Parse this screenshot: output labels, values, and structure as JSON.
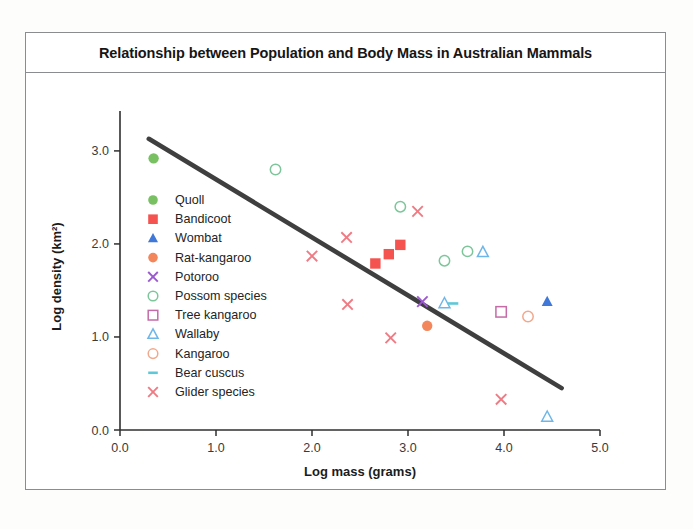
{
  "chart_data": {
    "type": "scatter",
    "title": "Relationship between Population and Body Mass in Australian Mammals",
    "xlabel": "Log mass (grams)",
    "ylabel": "Log density (km²)",
    "xlim": [
      0.0,
      5.0
    ],
    "ylim": [
      0.0,
      3.3
    ],
    "xticks": [
      "0.0",
      "1.0",
      "2.0",
      "3.0",
      "4.0",
      "5.0"
    ],
    "yticks": [
      "0.0",
      "1.0",
      "2.0",
      "3.0"
    ],
    "grid": false,
    "legend_position": "inside-left",
    "trendline": {
      "name": "regression-line",
      "color": "#3f3f3f",
      "x0": 0.3,
      "y0": 3.13,
      "x1": 4.6,
      "y1": 0.45
    },
    "series": [
      {
        "name": "Quoll",
        "marker": "circle-filled",
        "color": "#79c063",
        "points": [
          [
            0.35,
            2.92
          ]
        ]
      },
      {
        "name": "Bandicoot",
        "marker": "square-filled",
        "color": "#f4534f",
        "points": [
          [
            2.66,
            1.79
          ],
          [
            2.8,
            1.89
          ],
          [
            2.92,
            1.99
          ]
        ]
      },
      {
        "name": "Wombat",
        "marker": "triangle-filled",
        "color": "#3f78d8",
        "points": [
          [
            4.45,
            1.38
          ]
        ]
      },
      {
        "name": "Rat-kangaroo",
        "marker": "circle-filled",
        "color": "#f3865b",
        "points": [
          [
            3.2,
            1.12
          ]
        ]
      },
      {
        "name": "Potoroo",
        "marker": "cross",
        "color": "#9b59d0",
        "points": [
          [
            3.15,
            1.38
          ]
        ]
      },
      {
        "name": "Possom species",
        "marker": "circle-open",
        "color": "#7cc69a",
        "points": [
          [
            1.62,
            2.8
          ],
          [
            2.92,
            2.4
          ],
          [
            3.38,
            1.82
          ],
          [
            3.62,
            1.92
          ]
        ]
      },
      {
        "name": "Tree kangaroo",
        "marker": "square-open",
        "color": "#c46ba8",
        "points": [
          [
            3.97,
            1.27
          ]
        ]
      },
      {
        "name": "Wallaby",
        "marker": "triangle-open",
        "color": "#6fb6e8",
        "points": [
          [
            3.38,
            1.36
          ],
          [
            3.78,
            1.91
          ],
          [
            4.45,
            0.14
          ]
        ]
      },
      {
        "name": "Kangaroo",
        "marker": "circle-open",
        "color": "#f0a98c",
        "points": [
          [
            4.25,
            1.22
          ]
        ]
      },
      {
        "name": "Bear cuscus",
        "marker": "dash",
        "color": "#5fc8d8",
        "points": [
          [
            3.47,
            1.36
          ]
        ]
      },
      {
        "name": "Glider species",
        "marker": "cross",
        "color": "#ef7a83",
        "points": [
          [
            2.0,
            1.87
          ],
          [
            2.36,
            2.07
          ],
          [
            3.1,
            2.35
          ],
          [
            2.37,
            1.35
          ],
          [
            2.82,
            0.99
          ],
          [
            3.97,
            0.33
          ]
        ]
      }
    ]
  }
}
